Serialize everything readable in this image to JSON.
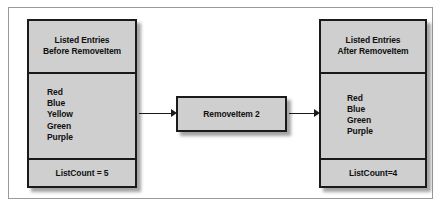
{
  "diagram": {
    "type": "flow-diagram",
    "before_panel": {
      "header_lines": [
        "Listed Entries",
        "Before RemoveItem"
      ],
      "entries": [
        "Red",
        "Blue",
        "Yellow",
        "Green",
        "Purple"
      ],
      "count_label": "ListCount = 5"
    },
    "process": {
      "label": "RemoveItem 2"
    },
    "after_panel": {
      "header_lines": [
        "Listed Entries",
        "After RemoveItem"
      ],
      "entries": [
        "Red",
        "Blue",
        "Green",
        "Purple"
      ],
      "count_label": "ListCount=4"
    },
    "arrows": [
      {
        "name": "arrow-before-to-process",
        "direction": "right"
      },
      {
        "name": "arrow-process-to-after",
        "direction": "right"
      }
    ],
    "caption": "",
    "colors": {
      "box_fill": "#cfcfcf",
      "box_border": "#1a1a1a",
      "frame_border": "#9a9a9a",
      "background": "#ffffff",
      "text": "#101010"
    }
  }
}
